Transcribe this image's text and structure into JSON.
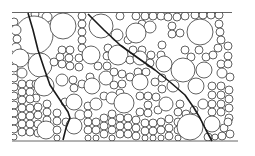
{
  "figure": {
    "colors": {
      "background": "#ffffff",
      "stroke": "#3a3a3a",
      "crack": "#1a1a1a",
      "border": "#555555"
    },
    "bounds": {
      "x0": 12,
      "y0": 12,
      "x1": 238,
      "y1": 141
    },
    "borders": [
      {
        "name": "top-border",
        "x1": 12,
        "y1": 12.5,
        "x2": 232,
        "y2": 12.5
      },
      {
        "name": "bottom-border",
        "x1": 12,
        "y1": 141,
        "x2": 238,
        "y2": 141
      }
    ],
    "cracks": [
      {
        "name": "crack-left",
        "points": "28,13 33,30 38,50 44,68 50,85 60,100 68,112 70,118 66,128 63,140"
      },
      {
        "name": "crack-diagonal",
        "points": "88,14 104,30 120,45 138,58 155,70 170,82 185,95 194,108 200,118 206,130 212,141"
      }
    ],
    "particles": [
      [
        35,
        14,
        4
      ],
      [
        47,
        17,
        5
      ],
      [
        34,
        35,
        19
      ],
      [
        14,
        22,
        4
      ],
      [
        16,
        30,
        5
      ],
      [
        17,
        39,
        4
      ],
      [
        16,
        48,
        5
      ],
      [
        63,
        26,
        13
      ],
      [
        82,
        16,
        4
      ],
      [
        82,
        24,
        4
      ],
      [
        82,
        32,
        4
      ],
      [
        82,
        40,
        4
      ],
      [
        82,
        48,
        4
      ],
      [
        101,
        26,
        12
      ],
      [
        120,
        16,
        4
      ],
      [
        117,
        35,
        6
      ],
      [
        128,
        40,
        4
      ],
      [
        136,
        16,
        4
      ],
      [
        145,
        16,
        4
      ],
      [
        153,
        16,
        4
      ],
      [
        161,
        16,
        4
      ],
      [
        168,
        17,
        4
      ],
      [
        177,
        17,
        4
      ],
      [
        185,
        16,
        4
      ],
      [
        195,
        15,
        4
      ],
      [
        203,
        15,
        4
      ],
      [
        211,
        15,
        4
      ],
      [
        219,
        15,
        4
      ],
      [
        142,
        24,
        4
      ],
      [
        150,
        27,
        6
      ],
      [
        136,
        33,
        10
      ],
      [
        172,
        26,
        4
      ],
      [
        172,
        34,
        4
      ],
      [
        180,
        33,
        4
      ],
      [
        200,
        32,
        13
      ],
      [
        219,
        24,
        4
      ],
      [
        220,
        32,
        4
      ],
      [
        221,
        40,
        4
      ],
      [
        218,
        48,
        4
      ],
      [
        228,
        46,
        4
      ],
      [
        20,
        58,
        9
      ],
      [
        14,
        68,
        4
      ],
      [
        22,
        73,
        5
      ],
      [
        14,
        78,
        4
      ],
      [
        40,
        65,
        12
      ],
      [
        62,
        50,
        4
      ],
      [
        70,
        50,
        4
      ],
      [
        60,
        57,
        4
      ],
      [
        69,
        58,
        4
      ],
      [
        54,
        62,
        4
      ],
      [
        62,
        64,
        4
      ],
      [
        70,
        66,
        4
      ],
      [
        79,
        58,
        4
      ],
      [
        79,
        67,
        4
      ],
      [
        91,
        55,
        9
      ],
      [
        108,
        48,
        4
      ],
      [
        107,
        56,
        4
      ],
      [
        98,
        66,
        4
      ],
      [
        107,
        66,
        4
      ],
      [
        118,
        55,
        10
      ],
      [
        133,
        50,
        4
      ],
      [
        142,
        50,
        4
      ],
      [
        130,
        60,
        4
      ],
      [
        140,
        58,
        7
      ],
      [
        151,
        55,
        4
      ],
      [
        161,
        55,
        4
      ],
      [
        162,
        45,
        4
      ],
      [
        150,
        63,
        4
      ],
      [
        164,
        64,
        8
      ],
      [
        185,
        50,
        4
      ],
      [
        191,
        57,
        4
      ],
      [
        199,
        50,
        4
      ],
      [
        206,
        57,
        4
      ],
      [
        213,
        55,
        4
      ],
      [
        228,
        56,
        4
      ],
      [
        221,
        64,
        4
      ],
      [
        228,
        64,
        4
      ],
      [
        183,
        70,
        12
      ],
      [
        204,
        70,
        8
      ],
      [
        222,
        73,
        5
      ],
      [
        230,
        77,
        4
      ],
      [
        14,
        87,
        4
      ],
      [
        14,
        96,
        4
      ],
      [
        22,
        84,
        4
      ],
      [
        22,
        92,
        4
      ],
      [
        22,
        100,
        4
      ],
      [
        30,
        84,
        4
      ],
      [
        30,
        92,
        4
      ],
      [
        36,
        84,
        4
      ],
      [
        36,
        98,
        4
      ],
      [
        30,
        99,
        4
      ],
      [
        44,
        86,
        10
      ],
      [
        62,
        80,
        6
      ],
      [
        73,
        80,
        4
      ],
      [
        74,
        88,
        4
      ],
      [
        82,
        84,
        4
      ],
      [
        90,
        77,
        4
      ],
      [
        92,
        86,
        8
      ],
      [
        106,
        78,
        7
      ],
      [
        114,
        72,
        4
      ],
      [
        122,
        74,
        4
      ],
      [
        114,
        85,
        4
      ],
      [
        122,
        84,
        4
      ],
      [
        120,
        93,
        4
      ],
      [
        130,
        77,
        4
      ],
      [
        138,
        72,
        4
      ],
      [
        146,
        72,
        4
      ],
      [
        140,
        82,
        8
      ],
      [
        155,
        82,
        4
      ],
      [
        162,
        78,
        4
      ],
      [
        162,
        89,
        4
      ],
      [
        173,
        86,
        6
      ],
      [
        196,
        86,
        8
      ],
      [
        212,
        86,
        4
      ],
      [
        212,
        95,
        4
      ],
      [
        221,
        86,
        4
      ],
      [
        221,
        95,
        4
      ],
      [
        229,
        90,
        4
      ],
      [
        229,
        99,
        4
      ],
      [
        14,
        105,
        4
      ],
      [
        14,
        113,
        4
      ],
      [
        14,
        121,
        4
      ],
      [
        14,
        129,
        4
      ],
      [
        14,
        137,
        3
      ],
      [
        22,
        108,
        4
      ],
      [
        22,
        116,
        4
      ],
      [
        22,
        124,
        4
      ],
      [
        22,
        132,
        4
      ],
      [
        30,
        108,
        4
      ],
      [
        30,
        116,
        4
      ],
      [
        30,
        124,
        4
      ],
      [
        30,
        132,
        4
      ],
      [
        38,
        107,
        4
      ],
      [
        38,
        115,
        4
      ],
      [
        38,
        124,
        4
      ],
      [
        38,
        133,
        4
      ],
      [
        47,
        104,
        4
      ],
      [
        47,
        112,
        4
      ],
      [
        47,
        120,
        4
      ],
      [
        46,
        130,
        9
      ],
      [
        57,
        113,
        4
      ],
      [
        57,
        121,
        4
      ],
      [
        57,
        130,
        4
      ],
      [
        57,
        138,
        3
      ],
      [
        65,
        102,
        4
      ],
      [
        74,
        102,
        8
      ],
      [
        80,
        115,
        5
      ],
      [
        88,
        106,
        4
      ],
      [
        88,
        114,
        4
      ],
      [
        96,
        104,
        6
      ],
      [
        104,
        96,
        4
      ],
      [
        112,
        98,
        6
      ],
      [
        124,
        103,
        10
      ],
      [
        140,
        96,
        4
      ],
      [
        148,
        96,
        4
      ],
      [
        148,
        105,
        4
      ],
      [
        156,
        97,
        4
      ],
      [
        140,
        112,
        4
      ],
      [
        148,
        113,
        4
      ],
      [
        158,
        110,
        4
      ],
      [
        166,
        104,
        7
      ],
      [
        180,
        104,
        4
      ],
      [
        178,
        112,
        4
      ],
      [
        186,
        114,
        4
      ],
      [
        194,
        110,
        4
      ],
      [
        203,
        104,
        5
      ],
      [
        212,
        104,
        4
      ],
      [
        212,
        112,
        4
      ],
      [
        221,
        104,
        4
      ],
      [
        221,
        112,
        4
      ],
      [
        229,
        108,
        4
      ],
      [
        229,
        118,
        4
      ],
      [
        66,
        122,
        4
      ],
      [
        74,
        126,
        8
      ],
      [
        88,
        122,
        4
      ],
      [
        88,
        130,
        4
      ],
      [
        88,
        138,
        3
      ],
      [
        96,
        122,
        4
      ],
      [
        96,
        130,
        4
      ],
      [
        96,
        138,
        3
      ],
      [
        104,
        118,
        4
      ],
      [
        104,
        126,
        4
      ],
      [
        104,
        134,
        4
      ],
      [
        112,
        114,
        4
      ],
      [
        112,
        122,
        4
      ],
      [
        112,
        130,
        4
      ],
      [
        112,
        138,
        3
      ],
      [
        120,
        118,
        4
      ],
      [
        120,
        126,
        4
      ],
      [
        120,
        134,
        4
      ],
      [
        128,
        118,
        4
      ],
      [
        128,
        126,
        4
      ],
      [
        128,
        134,
        4
      ],
      [
        136,
        120,
        4
      ],
      [
        136,
        128,
        4
      ],
      [
        136,
        136,
        4
      ],
      [
        145,
        123,
        4
      ],
      [
        145,
        131,
        4
      ],
      [
        145,
        138,
        3
      ],
      [
        153,
        123,
        4
      ],
      [
        153,
        131,
        4
      ],
      [
        153,
        138,
        3
      ],
      [
        161,
        122,
        4
      ],
      [
        161,
        130,
        4
      ],
      [
        161,
        138,
        3
      ],
      [
        169,
        119,
        4
      ],
      [
        169,
        128,
        4
      ],
      [
        169,
        136,
        4
      ],
      [
        178,
        122,
        4
      ],
      [
        178,
        130,
        4
      ],
      [
        178,
        138,
        3
      ],
      [
        190,
        127,
        13
      ],
      [
        212,
        124,
        8
      ],
      [
        224,
        128,
        4
      ],
      [
        228,
        122,
        4
      ],
      [
        222,
        136,
        4
      ],
      [
        230,
        134,
        4
      ],
      [
        208,
        137,
        4
      ],
      [
        215,
        137,
        3
      ]
    ]
  }
}
